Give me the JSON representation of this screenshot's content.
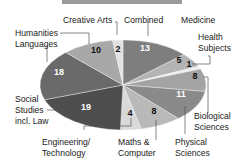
{
  "chart_data": {
    "type": "pie",
    "title": "",
    "start_angle_deg": -90,
    "direction": "clockwise",
    "slices": [
      {
        "name": "Combined",
        "value": 13,
        "color": "#7e7e7e",
        "text_color": "#ffffff"
      },
      {
        "name": "Medicine",
        "value": 5,
        "color": "#b4b4b4",
        "text_color": "#111111"
      },
      {
        "name": "Health Subjects",
        "value": 1,
        "color": "#ededed",
        "text_color": "#111111"
      },
      {
        "name": "Biological Sciences",
        "value": 8,
        "color": "#a3a3a3",
        "text_color": "#111111"
      },
      {
        "name": "Physical Sciences",
        "value": 11,
        "color": "#8a8a8a",
        "text_color": "#ffffff"
      },
      {
        "name": "Maths & Computer",
        "value": 8,
        "color": "#b9b9b9",
        "text_color": "#111111"
      },
      {
        "name": "Engineering/ Technology",
        "value": 4,
        "color": "#d9d9d9",
        "text_color": "#111111"
      },
      {
        "name": "Social Studies incl. Law",
        "value": 19,
        "color": "#4e4e4e",
        "text_color": "#ffffff"
      },
      {
        "name": "Languages",
        "value": 18,
        "color": "#6a6a6a",
        "text_color": "#ffffff"
      },
      {
        "name": "Humanities",
        "value": 10,
        "color": "#a8a8a8",
        "text_color": "#111111"
      },
      {
        "name": "Creative Arts",
        "value": 2,
        "color": "#e2e2e2",
        "text_color": "#111111"
      }
    ],
    "labels": {
      "creative_arts": "Creative Arts",
      "combined": "Combined",
      "medicine": "Medicine",
      "health_1": "Health",
      "health_2": "Subjects",
      "humanities": "Humanities",
      "languages": "Languages",
      "social_1": "Social",
      "social_2": "Studies",
      "social_3": "incl. Law",
      "bio_1": "Biological",
      "bio_2": "Sciences",
      "eng_1": "Engineering/",
      "eng_2": "Technology",
      "maths_1": "Maths &",
      "maths_2": "Computer",
      "phys_1": "Physical",
      "phys_2": "Sciences"
    },
    "values_text": {
      "combined": "13",
      "medicine": "5",
      "health": "1",
      "bio": "8",
      "phys": "11",
      "maths": "8",
      "eng": "4",
      "social": "19",
      "languages": "18",
      "humanities": "10",
      "creative": "2"
    },
    "legend": "none"
  }
}
